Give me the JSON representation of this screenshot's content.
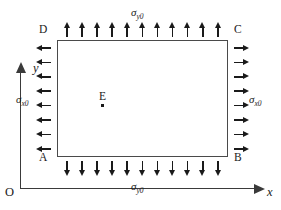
{
  "figure": {
    "type": "mechanics-stress-diagram",
    "width": 281,
    "height": 210,
    "line_color": "#4a4a4a",
    "arrow_color": "#1a1a1a",
    "background": "#ffffff"
  },
  "axes": {
    "origin_label": "O",
    "x_label": "x",
    "y_label": "y"
  },
  "plate": {
    "corners": {
      "top_left": "D",
      "top_right": "C",
      "bottom_left": "A",
      "bottom_right": "B"
    },
    "interior_point": {
      "label": "E"
    }
  },
  "loads": {
    "top": {
      "symbol": "σ",
      "subscript": "y0",
      "direction": "up",
      "count": 11
    },
    "bottom": {
      "symbol": "σ",
      "subscript": "y0",
      "direction": "down",
      "count": 11
    },
    "left": {
      "symbol": "σ",
      "subscript": "x0",
      "direction": "left",
      "count": 8
    },
    "right": {
      "symbol": "σ",
      "subscript": "x0",
      "direction": "right",
      "count": 8
    }
  }
}
